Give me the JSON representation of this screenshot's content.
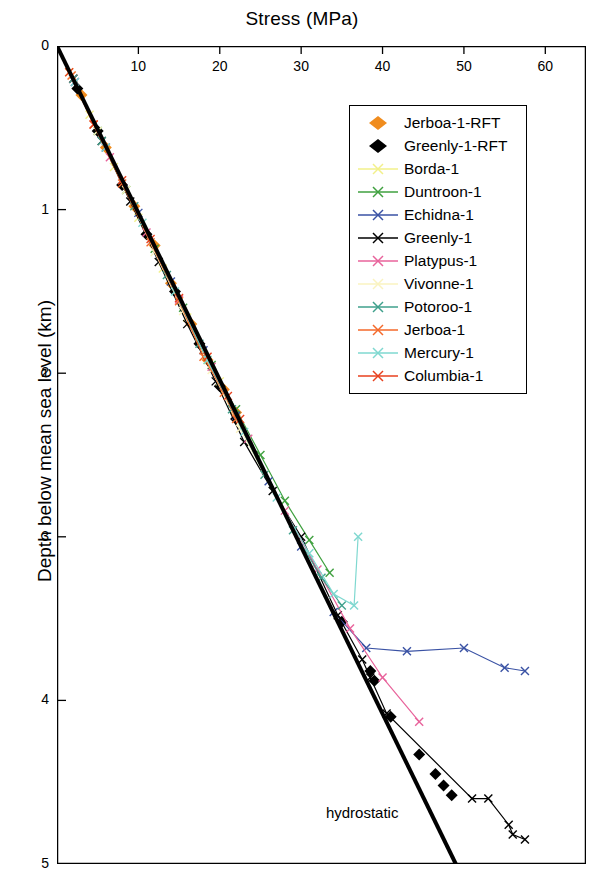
{
  "chart_data": {
    "type": "line",
    "title": "Stress (MPa)",
    "xlabel": "Stress (MPa)",
    "ylabel": "Depth below mean sea level (km)",
    "xlim": [
      0,
      65
    ],
    "ylim": [
      5,
      0
    ],
    "x_ticks": [
      10,
      20,
      30,
      40,
      50,
      60
    ],
    "y_ticks": [
      0,
      1,
      2,
      3,
      4,
      5
    ],
    "grid": false,
    "legend_position": "upper-right",
    "annotations": [
      {
        "text": "hydrostatic",
        "x": 37.5,
        "y": 4.72
      }
    ],
    "series": [
      {
        "name": "Jerboa-1-RFT",
        "color": "#F08C1E",
        "marker": "diamond",
        "line": false,
        "points": [
          [
            3.0,
            0.3
          ],
          [
            6.0,
            0.62
          ],
          [
            9.5,
            0.98
          ],
          [
            12.0,
            1.22
          ],
          [
            14.0,
            1.45
          ],
          [
            16.5,
            1.7
          ],
          [
            18.5,
            1.92
          ],
          [
            20.5,
            2.1
          ],
          [
            22.0,
            2.24
          ]
        ]
      },
      {
        "name": "Greenly-1-RFT",
        "color": "#000000",
        "marker": "diamond",
        "line": false,
        "points": [
          [
            2.5,
            0.26
          ],
          [
            5.0,
            0.52
          ],
          [
            8.0,
            0.85
          ],
          [
            11.0,
            1.15
          ],
          [
            14.5,
            1.5
          ],
          [
            17.5,
            1.82
          ],
          [
            20.0,
            2.08
          ],
          [
            22.0,
            2.28
          ],
          [
            35.0,
            3.52
          ],
          [
            38.5,
            3.82
          ],
          [
            39.0,
            3.88
          ],
          [
            41.0,
            4.1
          ],
          [
            44.5,
            4.33
          ],
          [
            46.5,
            4.45
          ],
          [
            47.5,
            4.52
          ],
          [
            48.5,
            4.58
          ]
        ]
      },
      {
        "name": "Borda-1",
        "color": "#F2F08A",
        "marker": "x",
        "line": true,
        "points": [
          [
            1.5,
            0.16
          ],
          [
            4.0,
            0.42
          ],
          [
            7.0,
            0.74
          ],
          [
            10.0,
            1.05
          ],
          [
            13.0,
            1.36
          ],
          [
            16.0,
            1.66
          ],
          [
            18.5,
            1.92
          ],
          [
            20.0,
            2.05
          ]
        ]
      },
      {
        "name": "Duntroon-1",
        "color": "#3FA03F",
        "marker": "x",
        "line": true,
        "points": [
          [
            2.0,
            0.2
          ],
          [
            5.0,
            0.52
          ],
          [
            8.5,
            0.88
          ],
          [
            12.0,
            1.24
          ],
          [
            15.5,
            1.6
          ],
          [
            19.0,
            1.95
          ],
          [
            22.0,
            2.22
          ],
          [
            25.0,
            2.5
          ],
          [
            28.0,
            2.78
          ],
          [
            31.0,
            3.02
          ],
          [
            33.5,
            3.22
          ]
        ]
      },
      {
        "name": "Echidna-1",
        "color": "#3A52A4",
        "marker": "x",
        "line": true,
        "points": [
          [
            2.2,
            0.22
          ],
          [
            6.0,
            0.62
          ],
          [
            10.0,
            1.02
          ],
          [
            14.0,
            1.44
          ],
          [
            18.0,
            1.86
          ],
          [
            22.0,
            2.26
          ],
          [
            26.0,
            2.66
          ],
          [
            30.0,
            3.06
          ],
          [
            34.0,
            3.46
          ],
          [
            38.0,
            3.68
          ],
          [
            43.0,
            3.7
          ],
          [
            50.0,
            3.68
          ],
          [
            55.0,
            3.8
          ],
          [
            57.5,
            3.82
          ]
        ]
      },
      {
        "name": "Greenly-1",
        "color": "#000000",
        "marker": "x",
        "line": true,
        "points": [
          [
            2.0,
            0.2
          ],
          [
            5.5,
            0.58
          ],
          [
            9.0,
            0.95
          ],
          [
            12.5,
            1.32
          ],
          [
            16.0,
            1.7
          ],
          [
            19.5,
            2.05
          ],
          [
            23.0,
            2.42
          ],
          [
            26.5,
            2.72
          ],
          [
            30.0,
            3.0
          ],
          [
            34.5,
            3.48
          ],
          [
            37.5,
            3.75
          ],
          [
            38.5,
            3.86
          ],
          [
            40.5,
            4.08
          ],
          [
            51.0,
            4.6
          ],
          [
            53.0,
            4.6
          ],
          [
            55.5,
            4.76
          ],
          [
            56.0,
            4.82
          ],
          [
            57.5,
            4.85
          ]
        ]
      },
      {
        "name": "Platypus-1",
        "color": "#E8639B",
        "marker": "x",
        "line": true,
        "points": [
          [
            2.0,
            0.2
          ],
          [
            6.5,
            0.68
          ],
          [
            11.0,
            1.14
          ],
          [
            15.0,
            1.55
          ],
          [
            19.0,
            1.96
          ],
          [
            23.5,
            2.4
          ],
          [
            28.0,
            2.84
          ],
          [
            32.0,
            3.2
          ],
          [
            36.0,
            3.56
          ],
          [
            40.0,
            3.86
          ],
          [
            44.5,
            4.13
          ]
        ]
      },
      {
        "name": "Vivonne-1",
        "color": "#FAF3C0",
        "marker": "x",
        "line": true,
        "points": [
          [
            1.8,
            0.18
          ],
          [
            5.0,
            0.52
          ],
          [
            8.5,
            0.88
          ],
          [
            12.0,
            1.26
          ],
          [
            15.5,
            1.62
          ],
          [
            19.0,
            1.98
          ],
          [
            22.5,
            2.34
          ],
          [
            25.5,
            2.62
          ]
        ]
      },
      {
        "name": "Potoroo-1",
        "color": "#3FA08C",
        "marker": "x",
        "line": true,
        "points": [
          [
            2.0,
            0.2
          ],
          [
            5.5,
            0.58
          ],
          [
            9.5,
            0.98
          ],
          [
            13.5,
            1.4
          ],
          [
            17.5,
            1.82
          ],
          [
            21.5,
            2.22
          ],
          [
            25.5,
            2.62
          ],
          [
            29.0,
            2.96
          ],
          [
            32.5,
            3.25
          ],
          [
            35.0,
            3.42
          ]
        ]
      },
      {
        "name": "Jerboa-1",
        "color": "#F4692A",
        "marker": "x",
        "line": true,
        "points": [
          [
            1.8,
            0.18
          ],
          [
            4.5,
            0.48
          ],
          [
            8.0,
            0.84
          ],
          [
            11.5,
            1.2
          ],
          [
            15.0,
            1.56
          ],
          [
            18.0,
            1.9
          ],
          [
            20.5,
            2.12
          ],
          [
            22.0,
            2.28
          ]
        ]
      },
      {
        "name": "Mercury-1",
        "color": "#7FD8D0",
        "marker": "x",
        "line": true,
        "points": [
          [
            2.2,
            0.22
          ],
          [
            6.0,
            0.62
          ],
          [
            10.5,
            1.08
          ],
          [
            14.5,
            1.5
          ],
          [
            18.5,
            1.92
          ],
          [
            23.0,
            2.36
          ],
          [
            27.0,
            2.76
          ],
          [
            31.0,
            3.1
          ],
          [
            34.0,
            3.35
          ],
          [
            36.5,
            3.42
          ],
          [
            37.0,
            3.0
          ]
        ]
      },
      {
        "name": "Columbia-1",
        "color": "#E8411E",
        "marker": "x",
        "line": true,
        "points": [
          [
            1.5,
            0.16
          ],
          [
            4.5,
            0.48
          ],
          [
            8.0,
            0.82
          ],
          [
            11.5,
            1.18
          ],
          [
            15.0,
            1.54
          ],
          [
            18.5,
            1.9
          ],
          [
            21.0,
            2.14
          ],
          [
            22.5,
            2.28
          ]
        ]
      },
      {
        "name": "hydrostatic",
        "color": "#000000",
        "marker": "none",
        "line": true,
        "width": 4,
        "points": [
          [
            0,
            0
          ],
          [
            49.0,
            5.0
          ]
        ]
      }
    ]
  },
  "axes": {
    "top_title": "Stress (MPa)",
    "left_title": "Depth below mean sea level (km)",
    "x_tick_labels": [
      "10",
      "20",
      "30",
      "40",
      "50",
      "60"
    ],
    "y_tick_labels": [
      "0",
      "1",
      "2",
      "3",
      "4",
      "5"
    ]
  },
  "annotation": {
    "hydrostatic": "hydrostatic"
  },
  "legend": {
    "items": [
      {
        "label": "Jerboa-1-RFT",
        "color": "#F08C1E",
        "marker": "diamond"
      },
      {
        "label": "Greenly-1-RFT",
        "color": "#000000",
        "marker": "diamond"
      },
      {
        "label": "Borda-1",
        "color": "#F2F08A",
        "marker": "x"
      },
      {
        "label": "Duntroon-1",
        "color": "#3FA03F",
        "marker": "x"
      },
      {
        "label": "Echidna-1",
        "color": "#3A52A4",
        "marker": "x"
      },
      {
        "label": "Greenly-1",
        "color": "#000000",
        "marker": "x"
      },
      {
        "label": "Platypus-1",
        "color": "#E8639B",
        "marker": "x"
      },
      {
        "label": "Vivonne-1",
        "color": "#FAF3C0",
        "marker": "x"
      },
      {
        "label": "Potoroo-1",
        "color": "#3FA08C",
        "marker": "x"
      },
      {
        "label": "Jerboa-1",
        "color": "#F4692A",
        "marker": "x"
      },
      {
        "label": "Mercury-1",
        "color": "#7FD8D0",
        "marker": "x"
      },
      {
        "label": "Columbia-1",
        "color": "#E8411E",
        "marker": "x"
      }
    ]
  }
}
